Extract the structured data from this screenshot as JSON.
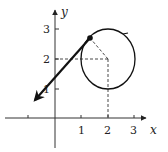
{
  "diagram": {
    "type": "parametric-circle-with-tangent",
    "axes": {
      "x_label": "x",
      "y_label": "y",
      "x_ticks": [
        "1",
        "2",
        "3"
      ],
      "y_ticks": [
        "1",
        "2",
        "3"
      ]
    },
    "circle": {
      "center": [
        2,
        2
      ],
      "radius": 1,
      "direction": "counterclockwise"
    },
    "point": [
      1.3,
      2.7
    ],
    "tangent_vector": {
      "from": [
        1.3,
        2.7
      ],
      "to": [
        -0.85,
        0.65
      ]
    },
    "colors": {
      "stroke": "#111111",
      "dash": "#333333",
      "background": "#ffffff"
    }
  }
}
